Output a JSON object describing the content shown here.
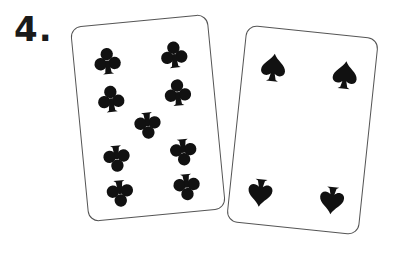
{
  "label": "4.",
  "cards": [
    {
      "name": "eight-of-clubs",
      "rank": "8",
      "suit": "clubs",
      "pips": [
        {
          "x": 33,
          "y": 36,
          "flip": false
        },
        {
          "x": 100,
          "y": 36,
          "flip": false
        },
        {
          "x": 33,
          "y": 74,
          "flip": false
        },
        {
          "x": 100,
          "y": 74,
          "flip": false
        },
        {
          "x": 67,
          "y": 105,
          "flip": true
        },
        {
          "x": 33,
          "y": 135,
          "flip": true
        },
        {
          "x": 100,
          "y": 135,
          "flip": true
        },
        {
          "x": 33,
          "y": 170,
          "flip": true
        },
        {
          "x": 100,
          "y": 170,
          "flip": true
        }
      ]
    },
    {
      "name": "four-of-spades",
      "rank": "4",
      "suit": "spades",
      "pips": [
        {
          "x": 30,
          "y": 38,
          "flip": false
        },
        {
          "x": 102,
          "y": 38,
          "flip": false
        },
        {
          "x": 30,
          "y": 166,
          "flip": true
        },
        {
          "x": 102,
          "y": 166,
          "flip": true
        }
      ]
    }
  ],
  "colors": {
    "ink": "#111111",
    "card_border": "#555555",
    "background": "#ffffff"
  }
}
